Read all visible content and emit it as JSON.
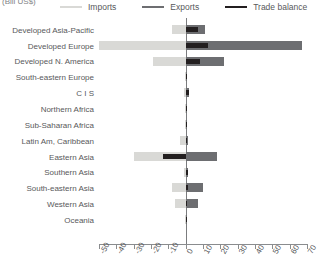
{
  "unit_label": "(Bill US$)",
  "legend": [
    {
      "name": "imports",
      "label": "Imports",
      "color": "#d9d9d6"
    },
    {
      "name": "exports",
      "label": "Exports",
      "color": "#6d6e71"
    },
    {
      "name": "trade-balance",
      "label": "Trade balance",
      "color": "#231f20"
    }
  ],
  "chart_data": {
    "type": "bar",
    "orientation": "horizontal",
    "title": "",
    "subtitle": "",
    "xlabel": "(Bill US$)",
    "ylabel": "",
    "xlim": [
      -50,
      70
    ],
    "xticks": [
      -50,
      -40,
      -30,
      -20,
      -10,
      0,
      10,
      20,
      30,
      40,
      50,
      60,
      70
    ],
    "xticklabels": [
      "-50",
      "-40",
      "-30",
      "-20",
      "-10",
      "0",
      "10",
      "20",
      "30",
      "40",
      "50",
      "60",
      "70"
    ],
    "grid": false,
    "legend_position": "top",
    "categories": [
      "Developed Asia-Pacific",
      "Developed Europe",
      "Developed N. America",
      "South-eastern Europe",
      "C I S",
      "Northern Africa",
      "Sub-Saharan Africa",
      "Latin Am, Caribbean",
      "Eastern Asia",
      "Southern Asia",
      "South-eastern Asia",
      "Western Asia",
      "Oceania"
    ],
    "series": [
      {
        "name": "Imports",
        "color": "#d9d9d6",
        "values": [
          -8,
          -50,
          -19,
          -0.5,
          -1,
          -0.5,
          -0.5,
          -3,
          -30,
          -1,
          -8,
          -6,
          -0.3
        ]
      },
      {
        "name": "Exports",
        "color": "#6d6e71",
        "values": [
          11,
          67,
          22,
          0.5,
          2,
          1,
          1,
          1.5,
          18,
          1.5,
          10,
          7,
          0.3
        ]
      },
      {
        "name": "Trade balance",
        "color": "#231f20",
        "values": [
          7,
          13,
          8,
          0.5,
          2,
          1,
          1,
          1,
          -13,
          1.5,
          1.5,
          1,
          0.3
        ]
      }
    ]
  }
}
